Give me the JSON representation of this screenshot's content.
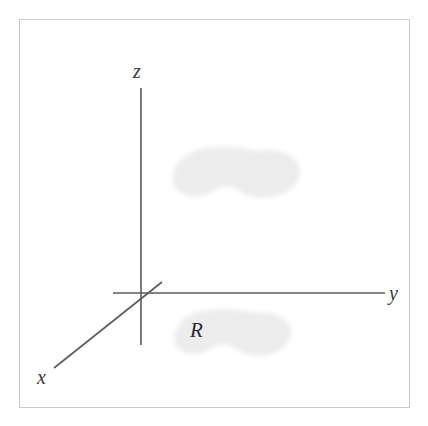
{
  "figure": {
    "kind": "math-diagram-3d-axes",
    "background_color": "#ffffff",
    "frame": {
      "border_color": "#c9c9c9",
      "border_width_px": 1,
      "x": 19,
      "y": 19,
      "width": 391,
      "height": 389
    },
    "axes": {
      "line_color": "#5a5a5e",
      "line_width_px": 1.6,
      "origin": {
        "x": 141,
        "y": 293
      },
      "items": [
        {
          "name": "z-axis",
          "label": "z",
          "orientation": "vertical",
          "from": {
            "x": 141,
            "y": 88
          },
          "to": {
            "x": 141,
            "y": 345
          },
          "label_position": {
            "x": 141,
            "y": 71
          }
        },
        {
          "name": "y-axis",
          "label": "y",
          "orientation": "horizontal",
          "from": {
            "x": 113,
            "y": 293
          },
          "to": {
            "x": 385,
            "y": 293
          },
          "label_position": {
            "x": 396,
            "y": 293
          }
        },
        {
          "name": "x-axis",
          "label": "x",
          "orientation": "diagonal-lower-left",
          "from": {
            "x": 54,
            "y": 368
          },
          "to": {
            "x": 162,
            "y": 282
          },
          "label_position": {
            "x": 45,
            "y": 378
          }
        }
      ]
    },
    "regions": [
      {
        "name": "upper-region-blob",
        "label": "",
        "description": "shaded peanut-shaped region floating above the xy-plane",
        "fill_color": "#efefef",
        "bounds": {
          "x": 171,
          "y": 147,
          "width": 131,
          "height": 54
        }
      },
      {
        "name": "lower-region-blob",
        "label": "R",
        "description": "shaded peanut-shaped region in the xy-plane labelled R",
        "fill_color": "#efefef",
        "bounds": {
          "x": 171,
          "y": 309,
          "width": 123,
          "height": 48
        }
      }
    ],
    "labels": {
      "z": "z",
      "y": "y",
      "x": "x",
      "region": "R"
    }
  }
}
